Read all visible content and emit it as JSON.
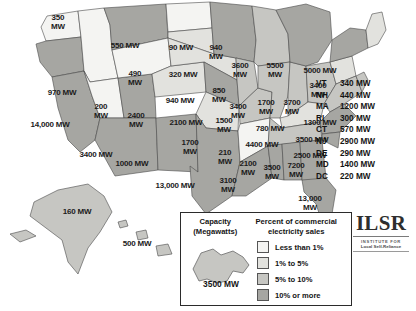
{
  "chart_data": {
    "type": "map",
    "unit": "MW",
    "legend": {
      "capacity_title": "Capacity\n(Megawatts)",
      "capacity_title_line1": "Capacity",
      "capacity_title_line2": "(Megawatts)",
      "percent_title_line1": "Percent of commercial",
      "percent_title_line2": "electricity sales",
      "sample_state": "New York",
      "sample_value": "3500 MW",
      "bins": [
        {
          "label": "Less than 1%",
          "color": "#f4f4f2"
        },
        {
          "label": "1% to 5%",
          "color": "#e2e2de"
        },
        {
          "label": "5% to 10%",
          "color": "#c6c6c2"
        },
        {
          "label": "10% or more",
          "color": "#a6a6a2"
        }
      ]
    },
    "states": [
      {
        "abbr": "WA",
        "value": "350\nMW",
        "tier": 0,
        "x": 58,
        "y": 22
      },
      {
        "abbr": "OR",
        "value": "970 MW",
        "tier": 3,
        "x": 62,
        "y": 92
      },
      {
        "abbr": "CA",
        "value": "14,000 MW",
        "tier": 3,
        "x": 50,
        "y": 124
      },
      {
        "abbr": "ID",
        "value": "490\nMW",
        "tier": 3,
        "x": 135,
        "y": 78
      },
      {
        "abbr": "MT",
        "value": "550 MW",
        "tier": 3,
        "x": 125,
        "y": 45
      },
      {
        "abbr": "NV",
        "value": "200\nMW",
        "tier": 0,
        "x": 101,
        "y": 111
      },
      {
        "abbr": "UT",
        "value": "2400\nMW",
        "tier": 3,
        "x": 136,
        "y": 120
      },
      {
        "abbr": "AZ",
        "value": "3400 MW",
        "tier": 3,
        "x": 96,
        "y": 154
      },
      {
        "abbr": "NM",
        "value": "1000 MW",
        "tier": 3,
        "x": 132,
        "y": 163
      },
      {
        "abbr": "WY",
        "value": "90 MW",
        "tier": 0,
        "x": 181,
        "y": 47
      },
      {
        "abbr": "CO",
        "value": "320 MW",
        "tier": 1,
        "x": 183,
        "y": 74
      },
      {
        "abbr": "ND",
        "value": "940\nMW",
        "tier": 0,
        "x": 216,
        "y": 52
      },
      {
        "abbr": "SD",
        "value": "940 MW",
        "tier": 1,
        "x": 180,
        "y": 100
      },
      {
        "abbr": "NE",
        "value": "850\nMW",
        "tier": 1,
        "x": 219,
        "y": 95
      },
      {
        "abbr": "KS",
        "value": "2100 MW",
        "tier": 3,
        "x": 186,
        "y": 122
      },
      {
        "abbr": "OK",
        "value": "1700\nMW",
        "tier": 1,
        "x": 190,
        "y": 147
      },
      {
        "abbr": "TX",
        "value": "13,000 MW",
        "tier": 3,
        "x": 175,
        "y": 185
      },
      {
        "abbr": "MN",
        "value": "3600\nMW",
        "tier": 3,
        "x": 240,
        "y": 70
      },
      {
        "abbr": "IA",
        "value": "3400\nMW",
        "tier": 2,
        "x": 238,
        "y": 111
      },
      {
        "abbr": "MO",
        "value": "1500\nMW",
        "tier": 2,
        "x": 224,
        "y": 125
      },
      {
        "abbr": "AR",
        "value": "210\nMW",
        "tier": 0,
        "x": 225,
        "y": 157
      },
      {
        "abbr": "LA",
        "value": "3100\nMW",
        "tier": 3,
        "x": 228,
        "y": 185
      },
      {
        "abbr": "WI",
        "value": "5500\nMW",
        "tier": 2,
        "x": 275,
        "y": 70
      },
      {
        "abbr": "IL",
        "value": "1700\nMW",
        "tier": 2,
        "x": 266,
        "y": 107
      },
      {
        "abbr": "IN",
        "value": "3700\nMW",
        "tier": 2,
        "x": 292,
        "y": 107
      },
      {
        "abbr": "MI",
        "value": "5000 MW",
        "tier": 3,
        "x": 320,
        "y": 70
      },
      {
        "abbr": "OH",
        "value": "3400\nMW",
        "tier": 2,
        "x": 318,
        "y": 90
      },
      {
        "abbr": "KY",
        "value": "780 MW",
        "tier": 1,
        "x": 270,
        "y": 128
      },
      {
        "abbr": "TN",
        "value": "4400 MW",
        "tier": 2,
        "x": 262,
        "y": 144
      },
      {
        "abbr": "MS",
        "value": "2100\nMW",
        "tier": 3,
        "x": 248,
        "y": 168
      },
      {
        "abbr": "AL",
        "value": "3500\nMW",
        "tier": 3,
        "x": 272,
        "y": 172
      },
      {
        "abbr": "GA",
        "value": "7200\nMW",
        "tier": 3,
        "x": 296,
        "y": 170
      },
      {
        "abbr": "FL",
        "value": "13,000\nMW",
        "tier": 3,
        "x": 310,
        "y": 203
      },
      {
        "abbr": "PA",
        "value": "1300 MW",
        "tier": 1,
        "x": 320,
        "y": 122
      },
      {
        "abbr": "VA",
        "value": "3500 MW",
        "tier": 2,
        "x": 312,
        "y": 139
      },
      {
        "abbr": "NC",
        "value": "2500 MW",
        "tier": 3,
        "x": 310,
        "y": 155
      },
      {
        "abbr": "AK",
        "value": "160 MW",
        "tier": 2,
        "x": 77,
        "y": 211
      },
      {
        "abbr": "HI",
        "value": "500 MW",
        "tier": 2,
        "x": 137,
        "y": 243
      }
    ],
    "small_states": [
      {
        "abbr": "VT",
        "value": "340 MW"
      },
      {
        "abbr": "NH",
        "value": "440 MW"
      },
      {
        "abbr": "MA",
        "value": "1200 MW"
      },
      {
        "abbr": "RI",
        "value": "300 MW"
      },
      {
        "abbr": "CT",
        "value": "570 MW"
      },
      {
        "abbr": "NJ",
        "value": "2900 MW"
      },
      {
        "abbr": "DE",
        "value": "290 MW"
      },
      {
        "abbr": "MD",
        "value": "1400 MW"
      },
      {
        "abbr": "DC",
        "value": "220 MW"
      }
    ]
  },
  "logo": {
    "mark": "ILSR",
    "subtitle_line1": "INSTITUTE FOR",
    "subtitle_line2": "Local Self-Reliance"
  }
}
